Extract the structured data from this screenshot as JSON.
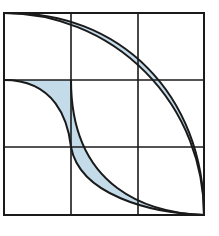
{
  "figure": {
    "grid": {
      "rows": 3,
      "cols": 3,
      "left": 4,
      "top": 13,
      "right": 204,
      "bottom": 215,
      "v_lines": [
        71,
        138
      ],
      "h_lines": [
        80,
        147
      ]
    },
    "colors": {
      "fill": "#c4dcea",
      "stroke": "#1a1a1a",
      "background": "#ffffff"
    },
    "bands": [
      {
        "name": "upper-band",
        "outer_curve": "M4,13 C120,10 204,95 204,215",
        "inner_curve": "M4,13 A200,202 0 0 1 204,215"
      },
      {
        "name": "lower-band",
        "outer_curve": "M71,80 C71,190 150,213 204,215",
        "inner_curve": "M4,80 C55,80 68,120 71,147 C80,195 150,213 204,215"
      }
    ]
  }
}
